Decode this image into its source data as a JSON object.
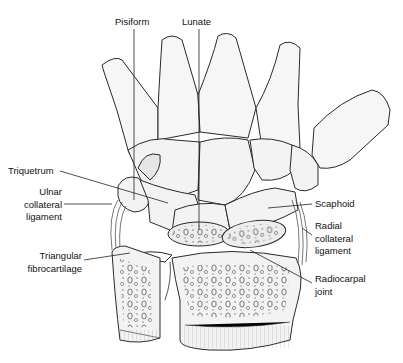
{
  "figure": {
    "labels": [
      {
        "id": "pisiform",
        "text": "Pisiform",
        "x": 115,
        "y": 16,
        "align": "left"
      },
      {
        "id": "lunate",
        "text": "Lunate",
        "x": 182,
        "y": 16,
        "align": "left"
      },
      {
        "id": "triquetrum",
        "text": "Triquetrum",
        "x": 8,
        "y": 165,
        "align": "left"
      },
      {
        "id": "ulnar-collateral-ligament",
        "lines": [
          "Ulnar",
          "collateral",
          "ligament"
        ],
        "x": 2,
        "y": 186,
        "align": "right",
        "width": 60
      },
      {
        "id": "scaphoid",
        "text": "Scaphoid",
        "x": 315,
        "y": 198,
        "align": "left"
      },
      {
        "id": "radial-collateral-ligament",
        "lines": [
          "Radial",
          "collateral",
          "ligament"
        ],
        "x": 315,
        "y": 220,
        "align": "left"
      },
      {
        "id": "triangular-fibrocartilage",
        "lines": [
          "Triangular",
          "fibrocartilage"
        ],
        "x": 2,
        "y": 250,
        "align": "right",
        "width": 80
      },
      {
        "id": "radiocarpal-joint",
        "lines": [
          "Radiocarpal",
          "joint"
        ],
        "x": 315,
        "y": 273,
        "align": "left"
      }
    ],
    "colors": {
      "line": "#2a2a2a",
      "bone_fill": "#f3f3f3",
      "marrow_fill": "#e4e4e4",
      "ligament": "#555555",
      "text": "#111111"
    }
  }
}
